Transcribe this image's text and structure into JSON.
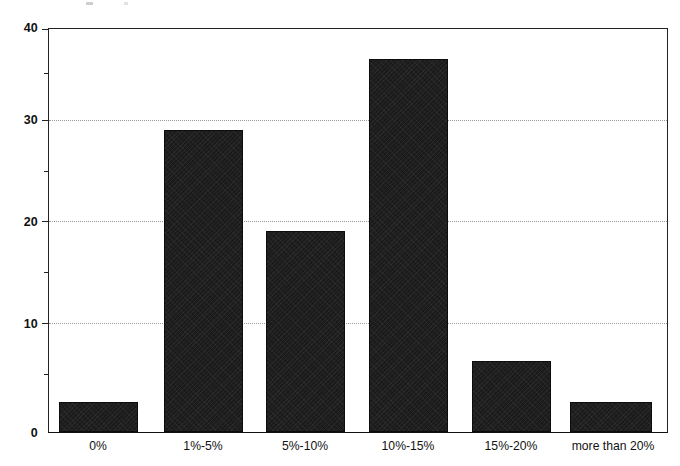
{
  "chart_data": {
    "type": "bar",
    "title": "",
    "xlabel": "",
    "ylabel": "",
    "categories": [
      "0%",
      "1%-5%",
      "5%-10%",
      "10%-15%",
      "15%-20%",
      "more than 20%"
    ],
    "values": [
      3,
      30,
      20,
      37,
      7,
      3
    ],
    "ylim": [
      0,
      40
    ],
    "y_major_ticks": [
      0,
      10,
      20,
      30,
      40
    ],
    "y_minor_ticks": [
      5,
      15,
      25,
      35
    ],
    "y_tick_labels": [
      "0",
      "10",
      "20",
      "30",
      "40"
    ],
    "gridlines": [
      10,
      20,
      30
    ],
    "grid": true,
    "legend": "none",
    "bar_color": "#1b1b1b",
    "axis_color": "#222222",
    "grid_color": "#9a9a9a",
    "background_color": "#ffffff"
  }
}
